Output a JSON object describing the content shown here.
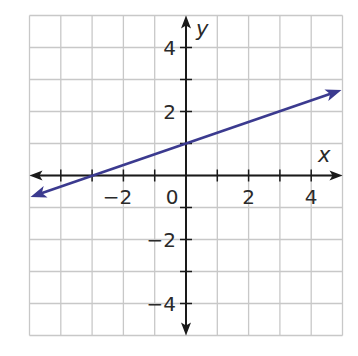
{
  "chart_data": {
    "type": "line",
    "title": "",
    "xlabel": "x",
    "ylabel": "y",
    "xlim": [
      -5,
      5
    ],
    "ylim": [
      -5,
      5
    ],
    "grid": true,
    "grid_step": 1,
    "x_tick_labels": [
      {
        "value": -2,
        "label": "−2"
      },
      {
        "value": 0,
        "label": "0"
      },
      {
        "value": 2,
        "label": "2"
      },
      {
        "value": 4,
        "label": "4"
      }
    ],
    "y_tick_labels": [
      {
        "value": 4,
        "label": "4"
      },
      {
        "value": 2,
        "label": "2"
      },
      {
        "value": -2,
        "label": "−2"
      },
      {
        "value": -4,
        "label": "−4"
      }
    ],
    "series": [
      {
        "name": "line",
        "equation": "y = (1/3)x + 1",
        "color": "#3b3a8f",
        "arrows": "both",
        "points": [
          {
            "x": -5,
            "y": -0.67
          },
          {
            "x": -3,
            "y": 0
          },
          {
            "x": 0,
            "y": 1
          },
          {
            "x": 3,
            "y": 2
          },
          {
            "x": 5,
            "y": 2.67
          }
        ]
      }
    ],
    "legend": null
  },
  "colors": {
    "grid": "#c8c8c8",
    "axis": "#1a1a1a",
    "line": "#3b3a8f"
  }
}
